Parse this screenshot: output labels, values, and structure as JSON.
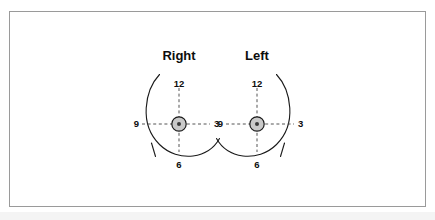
{
  "figure": {
    "kind": "breast-clock-face-diagram",
    "frame_color": "#9a9a9a",
    "background": "#ffffff",
    "line_color": "#1a1a1a",
    "dash_color": "#555555",
    "areola_fill": "#c9c9c9"
  },
  "panels": [
    {
      "id": "right",
      "title": "Right",
      "clock_labels": {
        "twelve": "12",
        "three": "3",
        "six": "6",
        "nine": "9"
      }
    },
    {
      "id": "left",
      "title": "Left",
      "clock_labels": {
        "twelve": "12",
        "three": "3",
        "six": "6",
        "nine": "9"
      }
    }
  ]
}
